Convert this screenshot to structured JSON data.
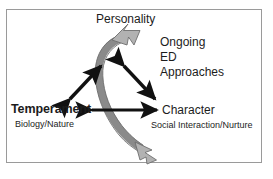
{
  "diagram": {
    "title_node": "Personality",
    "left_node": {
      "label": "Temperament",
      "sublabel": "Biology/Nature"
    },
    "right_node": {
      "label": "Character",
      "sublabel": "Social Interaction/Nurture"
    },
    "notes": [
      "Ongoing",
      "ED",
      "Approaches"
    ],
    "colors": {
      "frame": "#9a9a9a",
      "text": "#1c1c1c",
      "black_arrow": "#111111",
      "gray_arrow_body": "#8a8a8a",
      "gray_arrow_head": "#b2b2b2",
      "gray_arrow_outline": "#6e6e6e",
      "background": "#ffffff"
    },
    "connectors": [
      {
        "name": "temperament-to-personality",
        "style": "black-double-headed-diagonal"
      },
      {
        "name": "personality-to-character",
        "style": "black-double-headed-diagonal"
      },
      {
        "name": "temperament-to-character",
        "style": "black-double-headed-horizontal"
      },
      {
        "name": "ongoing-cycle",
        "style": "gray-curved-double-headed"
      }
    ]
  }
}
